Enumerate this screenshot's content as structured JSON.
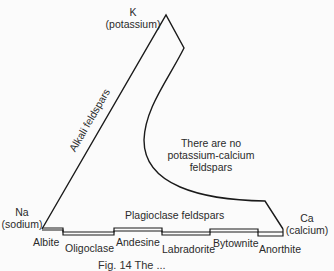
{
  "vertices": {
    "k": {
      "symbol": "K",
      "name": "(potassium)"
    },
    "na": {
      "symbol": "Na",
      "name": "(sodium)"
    },
    "ca": {
      "symbol": "Ca",
      "name": "(calcium)"
    }
  },
  "regions": {
    "alkali": "Alkali feldspars",
    "plagioclase": "Plagioclase feldspars",
    "gap_line1": "There are no",
    "gap_line2": "potassium-calcium",
    "gap_line3": "feldspars"
  },
  "plagioclase_series": [
    {
      "label": "Albite"
    },
    {
      "label": "Oligoclase"
    },
    {
      "label": "Andesine"
    },
    {
      "label": "Labradorite"
    },
    {
      "label": "Bytownite"
    },
    {
      "label": "Anorthite"
    }
  ],
  "caption": "Fig. 14 The ..."
}
